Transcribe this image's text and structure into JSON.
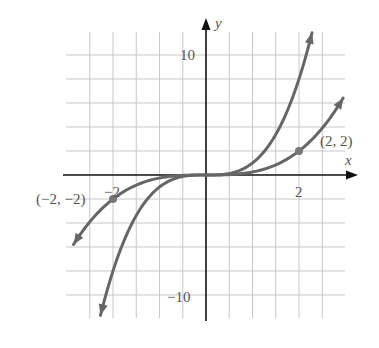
{
  "chart_data": {
    "type": "line",
    "title": "",
    "xlabel": "x",
    "ylabel": "y",
    "xlim": [
      -2.98,
      3.0
    ],
    "ylim": [
      -12,
      12
    ],
    "grid": true,
    "grid_step": {
      "x": 0.5,
      "y": 2
    },
    "tick_labels": {
      "x": [
        {
          "value": -2,
          "label": "−2"
        },
        {
          "value": 2,
          "label": "2"
        }
      ],
      "y": [
        {
          "value": 10,
          "label": "10"
        },
        {
          "value": -10,
          "label": "−10"
        }
      ]
    },
    "series": [
      {
        "name": "y = x^3",
        "expression": "x^3",
        "x_range": [
          -2.27,
          2.28
        ],
        "arrows": "both"
      },
      {
        "name": "y = x^3/4",
        "expression": "x^3/4",
        "x_range": [
          -2.85,
          2.95
        ],
        "arrows": "both"
      }
    ],
    "annotations": [
      {
        "point": [
          2,
          2
        ],
        "label": "(2, 2)",
        "marker": "dot"
      },
      {
        "point": [
          -2,
          -2
        ],
        "label": "(−2, −2)",
        "marker": "dot"
      }
    ],
    "colors": {
      "curve": "#666666",
      "grid": "#c8c8c8",
      "axis": "#111111",
      "text": "#555555"
    }
  }
}
